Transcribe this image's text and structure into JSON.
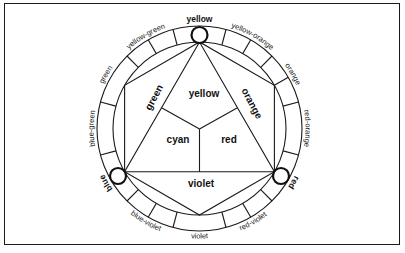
{
  "diagram": {
    "ring_labels": {
      "yellow": "yellow",
      "yellow_orange": "yellow-orange",
      "orange": "orange",
      "red_orange": "red-orange",
      "red": "red",
      "red_violet": "red-violet",
      "violet": "violet",
      "blue_violet": "blue-violet",
      "blue": "blue",
      "blue_green": "blue-green",
      "green": "green",
      "yellow_green": "yellow-green"
    },
    "inner_labels": {
      "yellow": "yellow",
      "green": "green",
      "orange": "orange",
      "cyan": "cyan",
      "red": "red",
      "violet": "violet"
    },
    "primary_markers": [
      "yellow",
      "red",
      "blue"
    ],
    "colors": {
      "stroke": "#1a1a1a",
      "background": "#ffffff"
    }
  }
}
